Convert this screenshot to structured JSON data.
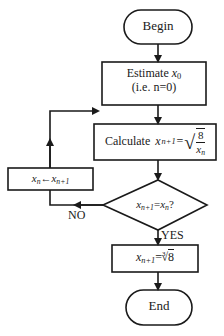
{
  "flowchart": {
    "begin": {
      "label": "Begin"
    },
    "estimate": {
      "line1": "Estimate",
      "var": "x",
      "sub": "0",
      "line2": "(i.e. n=0)"
    },
    "calculate": {
      "label": "Calculate",
      "lhs_var": "x",
      "lhs_sub": "n+1",
      "eq": "=",
      "num": "8",
      "den_var": "x",
      "den_sub": "n"
    },
    "decision": {
      "lhs_var": "x",
      "lhs_sub": "n+1",
      "eq": "=",
      "rhs_var": "x",
      "rhs_sub": "n",
      "q": "?"
    },
    "assign": {
      "lhs_var": "x",
      "lhs_sub": "n",
      "arrow": "←",
      "rhs_var": "x",
      "rhs_sub": "n+1"
    },
    "result": {
      "lhs_var": "x",
      "lhs_sub": "n+1",
      "eq": "=",
      "root_index": "3",
      "radicand": "8"
    },
    "end": {
      "label": "End"
    },
    "branches": {
      "no": "NO",
      "yes": "YES"
    }
  },
  "colors": {
    "stroke": "#1a1a1a",
    "background": "#ffffff"
  }
}
